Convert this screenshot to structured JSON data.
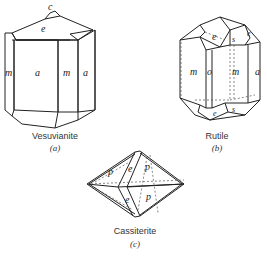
{
  "figures": [
    {
      "id": "a",
      "mineral": "Vesuvianite",
      "sub_label": "(a)",
      "face_labels": [
        "c",
        "e",
        "m",
        "a",
        "m",
        "a"
      ]
    },
    {
      "id": "b",
      "mineral": "Rutile",
      "sub_label": "(b)",
      "face_labels": [
        "e",
        "s",
        "e",
        "m",
        "o",
        "m",
        "a",
        "e",
        "s"
      ]
    },
    {
      "id": "c",
      "mineral": "Cassiterite",
      "sub_label": "(c)",
      "face_labels": [
        "p",
        "e",
        "p",
        "e",
        "p"
      ]
    }
  ],
  "colors": {
    "line": "#222222",
    "dashed": "#555555",
    "background": "#ffffff"
  }
}
